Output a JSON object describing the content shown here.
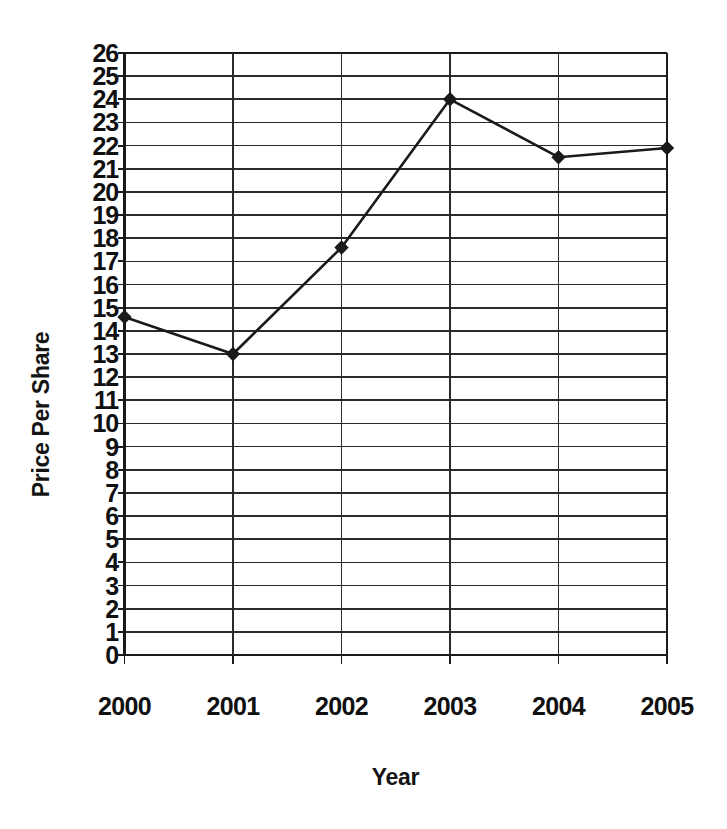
{
  "chart_data": {
    "type": "line",
    "title": "",
    "xlabel": "Year",
    "ylabel": "Price Per Share",
    "categories": [
      "2000",
      "2001",
      "2002",
      "2003",
      "2004",
      "2005"
    ],
    "values": [
      14.6,
      13.0,
      17.6,
      24.0,
      21.5,
      21.9
    ],
    "series": [
      {
        "name": "Price Per Share",
        "values": [
          14.6,
          13.0,
          17.6,
          24.0,
          21.5,
          21.9
        ]
      }
    ],
    "ylim": [
      0,
      26
    ],
    "ytick_labels": [
      "0",
      "1",
      "2",
      "3",
      "4",
      "5",
      "6",
      "7",
      "8",
      "9",
      "10",
      "11",
      "12",
      "13",
      "14",
      "15",
      "16",
      "17",
      "18",
      "19",
      "20",
      "21",
      "22",
      "23",
      "24",
      "25",
      "26"
    ],
    "ytick_values": [
      0,
      1,
      2,
      3,
      4,
      5,
      6,
      7,
      8,
      9,
      10,
      11,
      12,
      13,
      14,
      15,
      16,
      17,
      18,
      19,
      20,
      21,
      22,
      23,
      24,
      25,
      26
    ],
    "xtick_labels": [
      "2000",
      "2001",
      "2002",
      "2003",
      "2004",
      "2005"
    ],
    "grid": {
      "horizontal": true,
      "vertical": true
    },
    "legend": {
      "visible": false,
      "position": "none"
    },
    "marker": "diamond",
    "line_color": "#1a1a1a",
    "marker_color": "#1a1a1a",
    "grid_color": "#2b2b2b",
    "axis_color": "#1a1a1a",
    "background_color": "#ffffff"
  }
}
